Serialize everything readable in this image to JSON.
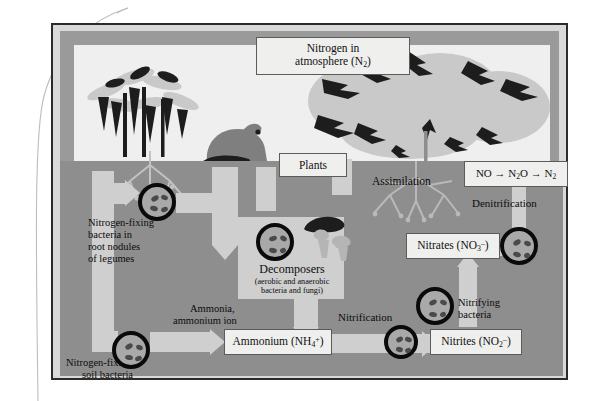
{
  "figure": {
    "atmosphere_box": "Nitrogen in atmosphere (N2)",
    "atmosphere_line1": "Nitrogen in",
    "atmosphere_line2_pre": "atmosphere (N",
    "atmosphere_sub": "2",
    "atmosphere_line2_post": ")",
    "plants_box": "Plants",
    "assimilation_label": "Assimilation",
    "root_nodule_bacteria_line1": "Nitrogen-fixing",
    "root_nodule_bacteria_line2": "bacteria in",
    "root_nodule_bacteria_line3": "root nodules",
    "root_nodule_bacteria_line4": "of legumes",
    "soil_bacteria_line1": "Nitrogen-fixing",
    "soil_bacteria_line2": "soil bacteria",
    "decomposers_title": "Decomposers",
    "decomposers_sub1": "(aerobic and anaerobic",
    "decomposers_sub2": "bacteria and fungi)",
    "ammonia_label_line1": "Ammonia,",
    "ammonia_label_line2": "ammonium ion",
    "ammonium_box_pre": "Ammonium (NH",
    "ammonium_box_sub": "4",
    "ammonium_box_sup": "+",
    "ammonium_box_post": ")",
    "nitrification_label": "Nitrification",
    "nitrites_box_pre": "Nitrites (NO",
    "nitrites_box_sub": "2",
    "nitrites_box_sup": "–",
    "nitrites_box_post": ")",
    "nitrates_box_pre": "Nitrates (NO",
    "nitrates_box_sub": "3",
    "nitrates_box_sup": "–",
    "nitrates_box_post": ")",
    "nitrifying_bacteria_line1": "Nitrifying",
    "nitrifying_bacteria_line2": "bacteria",
    "denitrification_label": "Denitrification",
    "gas_box_no": "NO",
    "gas_box_arrow1": "→",
    "gas_box_n2o_pre": "N",
    "gas_box_n2o_sub": "2",
    "gas_box_n2o_post": "O",
    "gas_box_arrow2": "→",
    "gas_box_n2_pre": "N",
    "gas_box_n2_sub": "2"
  },
  "colors": {
    "frame": "#2b2b2b",
    "mat": "#d9d9d9",
    "sky": "#efefef",
    "soil": "#949494",
    "soil_dark": "#8e8e8e",
    "arrow": "#cfcfcf",
    "box_fill": "#efefee",
    "box_stroke": "#5b5b5b",
    "ink": "#0c0c0c",
    "bacteria_ring": "#0a0a0a",
    "foliage_dark": "#1d1d1d",
    "foliage_light": "#c9c9c9"
  }
}
